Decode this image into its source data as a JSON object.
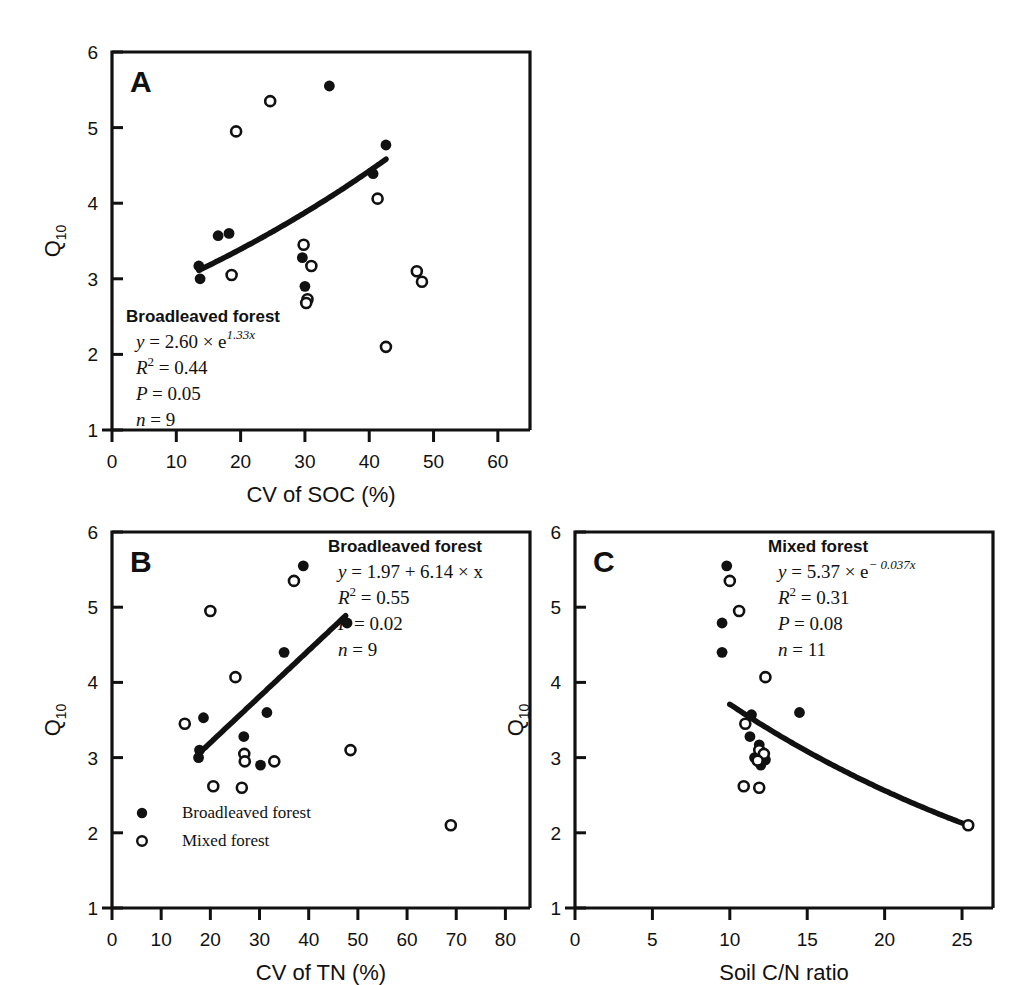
{
  "figure": {
    "y_axis_label": "Q",
    "y_axis_label_sub": "10"
  },
  "chart_data": [
    {
      "id": "A",
      "type": "scatter",
      "panel_letter": "A",
      "title": "",
      "xlabel": "CV of SOC (%)",
      "ylabel": "Q10",
      "xlim": [
        0,
        65
      ],
      "ylim": [
        1,
        6
      ],
      "xticks": [
        0,
        10,
        20,
        30,
        40,
        50,
        60
      ],
      "yticks": [
        1,
        2,
        3,
        4,
        5,
        6
      ],
      "grid": false,
      "legend_position": "none",
      "annotation": {
        "header": "Broadleaved forest",
        "equation_lhs": "y",
        "equation_rhs": "= 2.60 × e",
        "equation_exp": "1.33x",
        "r2_label": "R",
        "r2_sup": "2",
        "r2_value": "= 0.44",
        "p_label": "P",
        "p_value": "= 0.05",
        "n_label": "n",
        "n_value": "= 9"
      },
      "series": [
        {
          "name": "Broadleaved forest",
          "marker": "filled-circle",
          "points": [
            {
              "x": 13.5,
              "y": 3.17
            },
            {
              "x": 13.7,
              "y": 3.0
            },
            {
              "x": 16.5,
              "y": 3.57
            },
            {
              "x": 18.2,
              "y": 3.6
            },
            {
              "x": 29.6,
              "y": 3.28
            },
            {
              "x": 30.0,
              "y": 2.9
            },
            {
              "x": 33.8,
              "y": 5.55
            },
            {
              "x": 40.6,
              "y": 4.39
            },
            {
              "x": 42.6,
              "y": 4.77
            }
          ]
        },
        {
          "name": "Mixed forest",
          "marker": "open-circle",
          "points": [
            {
              "x": 18.6,
              "y": 3.05
            },
            {
              "x": 24.6,
              "y": 5.35
            },
            {
              "x": 19.3,
              "y": 4.95
            },
            {
              "x": 29.8,
              "y": 3.45
            },
            {
              "x": 31.0,
              "y": 3.17
            },
            {
              "x": 30.4,
              "y": 2.73
            },
            {
              "x": 41.3,
              "y": 4.06
            },
            {
              "x": 42.6,
              "y": 2.1
            },
            {
              "x": 47.4,
              "y": 3.1
            },
            {
              "x": 48.2,
              "y": 2.96
            },
            {
              "x": 30.2,
              "y": 2.68
            }
          ]
        }
      ],
      "fit_curve": {
        "name": "Broadleaved forest exponential fit",
        "model": "exponential",
        "a": 2.6,
        "b": 1.33,
        "x_start": 13.5,
        "x_end": 42.6
      }
    },
    {
      "id": "B",
      "type": "scatter",
      "panel_letter": "B",
      "title": "",
      "xlabel": "CV of TN (%)",
      "ylabel": "Q10",
      "xlim": [
        0,
        85
      ],
      "ylim": [
        1,
        6
      ],
      "xticks": [
        0,
        10,
        20,
        30,
        40,
        50,
        60,
        70,
        80
      ],
      "yticks": [
        1,
        2,
        3,
        4,
        5,
        6
      ],
      "grid": false,
      "legend_position": "bottom-left",
      "legend": [
        {
          "label": "Broadleaved forest",
          "marker": "filled-circle"
        },
        {
          "label": "Mixed forest",
          "marker": "open-circle"
        }
      ],
      "annotation": {
        "header": "Broadleaved forest",
        "equation_lhs": "y",
        "equation_rhs": "= 1.97 + 6.14 × x",
        "equation_exp": "",
        "r2_label": "R",
        "r2_sup": "2",
        "r2_value": "= 0.55",
        "p_label": "P",
        "p_value": "= 0.02",
        "n_label": "n",
        "n_value": "= 9"
      },
      "series": [
        {
          "name": "Broadleaved forest",
          "marker": "filled-circle",
          "points": [
            {
              "x": 17.6,
              "y": 3.0
            },
            {
              "x": 17.8,
              "y": 3.1
            },
            {
              "x": 18.6,
              "y": 3.53
            },
            {
              "x": 26.8,
              "y": 3.28
            },
            {
              "x": 30.2,
              "y": 2.9
            },
            {
              "x": 31.5,
              "y": 3.6
            },
            {
              "x": 35.0,
              "y": 4.4
            },
            {
              "x": 38.9,
              "y": 5.55
            },
            {
              "x": 47.8,
              "y": 4.79
            }
          ]
        },
        {
          "name": "Mixed forest",
          "marker": "open-circle",
          "points": [
            {
              "x": 14.8,
              "y": 3.45
            },
            {
              "x": 20.0,
              "y": 4.95
            },
            {
              "x": 20.6,
              "y": 2.62
            },
            {
              "x": 25.1,
              "y": 4.07
            },
            {
              "x": 26.9,
              "y": 3.05
            },
            {
              "x": 27.0,
              "y": 2.95
            },
            {
              "x": 26.4,
              "y": 2.6
            },
            {
              "x": 33.0,
              "y": 2.95
            },
            {
              "x": 37.0,
              "y": 5.35
            },
            {
              "x": 48.5,
              "y": 3.1
            },
            {
              "x": 68.9,
              "y": 2.1
            }
          ]
        }
      ],
      "fit_curve": {
        "name": "Broadleaved forest linear fit",
        "model": "linear",
        "intercept": 1.97,
        "slope": 6.14,
        "x_start": 17.5,
        "x_end": 47.5
      }
    },
    {
      "id": "C",
      "type": "scatter",
      "panel_letter": "C",
      "title": "",
      "xlabel": "Soil C/N ratio",
      "ylabel": "Q10",
      "xlim": [
        0,
        27
      ],
      "ylim": [
        1,
        6
      ],
      "xticks": [
        0,
        5,
        10,
        15,
        20,
        25
      ],
      "yticks": [
        1,
        2,
        3,
        4,
        5,
        6
      ],
      "grid": false,
      "legend_position": "none",
      "annotation": {
        "header": "Mixed forest",
        "equation_lhs": "y",
        "equation_rhs": "= 5.37 × e",
        "equation_exp": "− 0.037x",
        "r2_label": "R",
        "r2_sup": "2",
        "r2_value": "= 0.31",
        "p_label": "P",
        "p_value": "= 0.08",
        "n_label": "n",
        "n_value": "= 11"
      },
      "series": [
        {
          "name": "Broadleaved forest",
          "marker": "filled-circle",
          "points": [
            {
              "x": 9.8,
              "y": 5.55
            },
            {
              "x": 9.5,
              "y": 4.79
            },
            {
              "x": 9.5,
              "y": 4.4
            },
            {
              "x": 11.4,
              "y": 3.57
            },
            {
              "x": 11.3,
              "y": 3.28
            },
            {
              "x": 11.9,
              "y": 3.17
            },
            {
              "x": 12.1,
              "y": 3.05
            },
            {
              "x": 12.3,
              "y": 2.97
            },
            {
              "x": 11.6,
              "y": 3.0
            },
            {
              "x": 12.0,
              "y": 2.9
            },
            {
              "x": 14.5,
              "y": 3.6
            }
          ]
        },
        {
          "name": "Mixed forest",
          "marker": "open-circle",
          "points": [
            {
              "x": 10.0,
              "y": 5.35
            },
            {
              "x": 10.6,
              "y": 4.95
            },
            {
              "x": 12.3,
              "y": 4.07
            },
            {
              "x": 11.0,
              "y": 3.45
            },
            {
              "x": 11.9,
              "y": 3.1
            },
            {
              "x": 12.2,
              "y": 3.05
            },
            {
              "x": 11.8,
              "y": 2.96
            },
            {
              "x": 10.9,
              "y": 2.62
            },
            {
              "x": 11.9,
              "y": 2.6
            },
            {
              "x": 25.4,
              "y": 2.1
            }
          ]
        }
      ],
      "fit_curve": {
        "name": "Mixed forest exponential fit",
        "model": "exponential",
        "a": 5.37,
        "b": -0.037,
        "x_start": 10.0,
        "x_end": 25.6
      }
    }
  ]
}
